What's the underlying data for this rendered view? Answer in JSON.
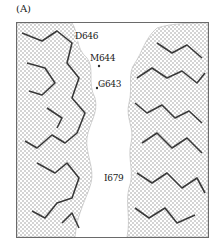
{
  "figure": {
    "panel_label": "(A)",
    "residue_labels": [
      {
        "id": "d646",
        "text": "D646",
        "x": 75,
        "y": 31
      },
      {
        "id": "m644",
        "text": "M644",
        "x": 90,
        "y": 53
      },
      {
        "id": "g643",
        "text": "G643",
        "x": 98,
        "y": 79
      },
      {
        "id": "i679",
        "text": "I679",
        "x": 104,
        "y": 173
      }
    ],
    "colors": {
      "mesh": "#9a9a9a",
      "sticks": "#3a3a3a",
      "frame": "#6a6a6a",
      "background": "#ffffff"
    }
  }
}
